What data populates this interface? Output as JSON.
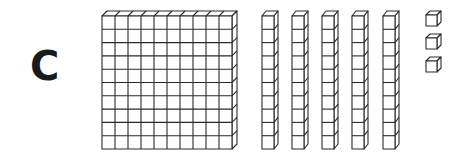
{
  "figure": {
    "label": "C",
    "line_color": "#2a2a2a",
    "background": "#ffffff"
  },
  "blocks": {
    "flats": {
      "count": 1,
      "rows": 10,
      "cols": 10
    },
    "rods": {
      "count": 5,
      "units_per_rod": 10
    },
    "units": {
      "count": 3
    }
  },
  "represented_value": 153
}
